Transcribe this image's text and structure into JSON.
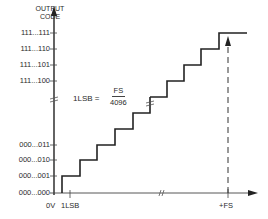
{
  "diagram": {
    "type": "adc-transfer-function-staircase",
    "y_axis": {
      "title_line1": "OUTPUT",
      "title_line2": "CODE",
      "tick_labels_top": [
        "111...111",
        "111...110",
        "111...101",
        "111...100"
      ],
      "tick_labels_bottom": [
        "000...011",
        "000...010",
        "000...001",
        "000...000"
      ]
    },
    "x_axis": {
      "origin_label": "0V",
      "first_tick_label": "1LSB",
      "end_label": "+FS"
    },
    "formula": {
      "lhs": "1LSB =",
      "numerator": "FS",
      "denominator": "4096"
    },
    "colors": {
      "line": "#333333",
      "text": "#2a2a2a",
      "background": "#ffffff"
    }
  }
}
